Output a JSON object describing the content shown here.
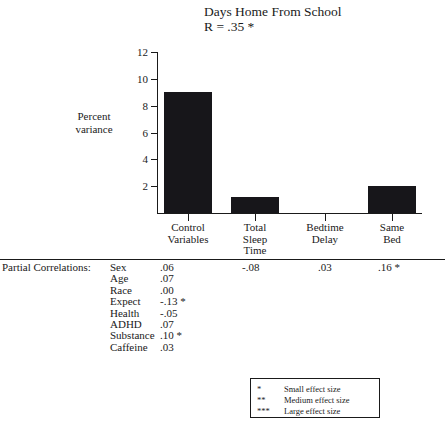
{
  "chart_data": {
    "type": "bar",
    "title": "Days Home From School",
    "subtitle": "R = .35 *",
    "xlabel": "",
    "ylabel": "Percent variance",
    "ylim": [
      0,
      12
    ],
    "yticks": [
      12,
      10,
      8,
      6,
      4,
      2
    ],
    "grid": false,
    "legend_position": "bottom-right",
    "categories": [
      "Control Variables",
      "Total Sleep Time",
      "Bedtime Delay",
      "Same Bed"
    ],
    "category_lines": [
      [
        "Control",
        "Variables"
      ],
      [
        "Total",
        "Sleep",
        "Time"
      ],
      [
        "Bedtime",
        "Delay"
      ],
      [
        "Same",
        "Bed"
      ]
    ],
    "values": [
      9.0,
      1.2,
      0.0,
      2.0
    ],
    "bar_color": "#17161a"
  },
  "partial_correlations": {
    "label": "Partial Correlations:",
    "control_variables": [
      {
        "name": "Sex",
        "value": ".06"
      },
      {
        "name": "Age",
        "value": ".07"
      },
      {
        "name": "Race",
        "value": ".00"
      },
      {
        "name": "Expect",
        "value": "-.13 *"
      },
      {
        "name": "Health",
        "value": "-.05"
      },
      {
        "name": "ADHD",
        "value": ".07"
      },
      {
        "name": "Substance",
        "value": ".10 *"
      },
      {
        "name": "Caffeine",
        "value": ".03"
      }
    ],
    "column_values": {
      "total_sleep_time": "-.08",
      "bedtime_delay": ".03",
      "same_bed": ".16 *"
    }
  },
  "legend": {
    "rows": [
      {
        "marker": "*",
        "text": "Small effect size"
      },
      {
        "marker": "**",
        "text": "Medium effect size"
      },
      {
        "marker": "***",
        "text": "Large effect size"
      }
    ]
  }
}
